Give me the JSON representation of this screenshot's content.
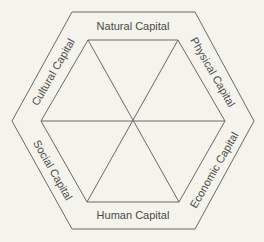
{
  "diagram": {
    "title": "",
    "colors": {
      "background": "#f4f3ec",
      "line": "#6a6a66",
      "text": "#4a4a48"
    },
    "center": [
      133,
      121
    ],
    "outer_hexagon": [
      [
        72,
        12
      ],
      [
        195,
        12
      ],
      [
        254,
        121
      ],
      [
        195,
        229
      ],
      [
        72,
        229
      ],
      [
        12,
        121
      ]
    ],
    "inner_hexagon": [
      [
        88,
        40
      ],
      [
        178,
        40
      ],
      [
        225,
        121
      ],
      [
        179,
        202
      ],
      [
        87,
        202
      ],
      [
        41,
        121
      ]
    ],
    "labels": [
      {
        "id": "natural",
        "text": "Natural Capital",
        "x": 133,
        "y": 26,
        "rotate": 0
      },
      {
        "id": "physical",
        "text": "Physical Capital",
        "x": 213,
        "y": 72,
        "rotate": 60
      },
      {
        "id": "economic",
        "text": "Economic Capital",
        "x": 214,
        "y": 170,
        "rotate": -60
      },
      {
        "id": "human",
        "text": "Human Capital",
        "x": 133,
        "y": 215,
        "rotate": 0
      },
      {
        "id": "social",
        "text": "Social Capital",
        "x": 53,
        "y": 170,
        "rotate": 60
      },
      {
        "id": "cultural",
        "text": "Cultural Capital",
        "x": 53,
        "y": 72,
        "rotate": -60
      }
    ]
  }
}
